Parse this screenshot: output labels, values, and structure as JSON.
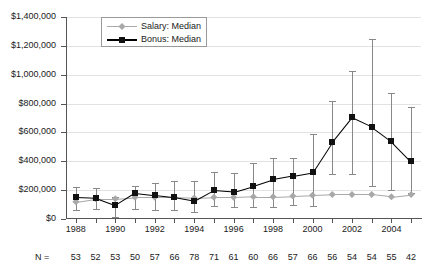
{
  "chart_data": {
    "type": "line",
    "title": "",
    "xlabel": "",
    "ylabel": "",
    "x": [
      1988,
      1989,
      1990,
      1991,
      1992,
      1993,
      1994,
      1995,
      1996,
      1997,
      1998,
      1999,
      2000,
      2001,
      2002,
      2003,
      2004,
      2005
    ],
    "xlim": [
      1987.5,
      2005.5
    ],
    "ylim": [
      0,
      1400000
    ],
    "grid": true,
    "legend_position": "top-left-inside",
    "ytick_labels": [
      "$0",
      "$200,000",
      "$400,000",
      "$600,000",
      "$800,000",
      "$1,000,000",
      "$1,200,000",
      "$1,400,000"
    ],
    "ytick_values": [
      0,
      200000,
      400000,
      600000,
      800000,
      1000000,
      1200000,
      1400000
    ],
    "xtick_labels": [
      "1988",
      "1990",
      "1992",
      "1994",
      "1996",
      "1998",
      "2000",
      "2002",
      "2004"
    ],
    "xtick_values": [
      1988,
      1990,
      1992,
      1994,
      1996,
      1998,
      2000,
      2002,
      2004
    ],
    "series": [
      {
        "name": "Salary: Median",
        "color": "#a8a8a8",
        "marker": "diamond",
        "values": [
          120000,
          140000,
          140000,
          150000,
          150000,
          150000,
          145000,
          150000,
          150000,
          155000,
          155000,
          160000,
          165000,
          170000,
          170000,
          170000,
          155000,
          170000
        ]
      },
      {
        "name": "Bonus: Median",
        "color": "#111111",
        "marker": "square",
        "values": [
          150000,
          145000,
          95000,
          180000,
          165000,
          150000,
          125000,
          200000,
          190000,
          230000,
          275000,
          300000,
          325000,
          535000,
          705000,
          640000,
          540000,
          400000
        ],
        "error_high": [
          225000,
          215000,
          150000,
          230000,
          250000,
          260000,
          265000,
          325000,
          320000,
          390000,
          420000,
          420000,
          590000,
          820000,
          1025000,
          1250000,
          870000,
          775000
        ],
        "error_low": [
          65000,
          70000,
          15000,
          70000,
          65000,
          60000,
          50000,
          90000,
          80000,
          80000,
          80000,
          100000,
          90000,
          310000,
          310000,
          230000,
          200000,
          180000
        ]
      }
    ],
    "n_label": "N =",
    "n_values": [
      53,
      52,
      53,
      50,
      57,
      66,
      78,
      71,
      61,
      60,
      66,
      57,
      66,
      56,
      54,
      54,
      55,
      42
    ]
  }
}
